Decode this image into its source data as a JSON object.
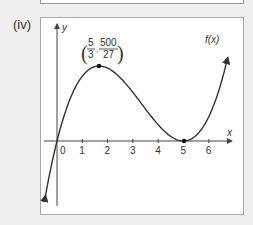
{
  "part_label": "(iv)",
  "chart_data": {
    "type": "line",
    "title": "",
    "function_label": "f(x)",
    "function": "x(x-5)^2",
    "xlabel": "x",
    "ylabel": "y",
    "x_ticks": [
      "0",
      "1",
      "2",
      "3",
      "4",
      "5",
      "6"
    ],
    "xlim": [
      -0.4,
      6.9
    ],
    "grid": false,
    "annotations": [
      {
        "type": "point",
        "x": 1.667,
        "y": 18.52,
        "label": "(5/3, 500/27)",
        "label_num_x": "5",
        "label_den_x": "3",
        "label_num_y": "500",
        "label_den_y": "27"
      },
      {
        "type": "point",
        "x": 5,
        "y": 0
      }
    ],
    "x": [
      -0.5,
      0,
      0.5,
      1,
      1.667,
      2,
      3,
      4,
      5,
      6,
      6.8
    ],
    "values": [
      -15.13,
      0,
      10.13,
      16,
      18.52,
      18,
      12,
      4,
      0,
      6,
      22.03
    ]
  },
  "colors": {
    "curve": "#333333",
    "axis": "#444444",
    "background": "#efefef",
    "panel": "#ffffff"
  }
}
